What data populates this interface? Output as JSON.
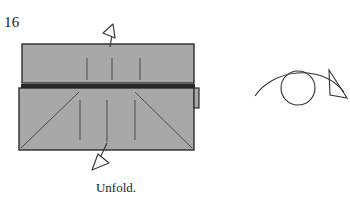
{
  "figure": {
    "step_number": "16",
    "caption": "Unfold."
  },
  "colors": {
    "background": "#ffffff",
    "paper_fill": "#a8a8a8",
    "paper_edge": "#2b2b2b",
    "crease_line": "#4a4a4a",
    "arrow_stroke": "#3a3a3a",
    "arrow_fill": "#ffffff",
    "turnover_stroke": "#333333",
    "shadow_band": "#262626"
  },
  "diagram": {
    "upper_panel": {
      "name": "upper-paper-panel",
      "x": 22,
      "y": 44,
      "width": 172,
      "height": 39,
      "creases": [
        {
          "x": 87,
          "y1": 58,
          "y2": 80
        },
        {
          "x": 112,
          "y1": 58,
          "y2": 80
        },
        {
          "x": 140,
          "y1": 58,
          "y2": 80
        }
      ]
    },
    "lower_panel": {
      "name": "lower-paper-panel",
      "x": 19,
      "y": 88,
      "width": 175,
      "height": 62,
      "creases": [
        {
          "x": 80,
          "y1": 100,
          "y2": 140
        },
        {
          "x": 107,
          "y1": 100,
          "y2": 142
        },
        {
          "x": 135,
          "y1": 100,
          "y2": 140
        }
      ],
      "diagonals": [
        {
          "x1": 21,
          "y1": 148,
          "x2": 79,
          "y2": 92
        },
        {
          "x1": 192,
          "y1": 148,
          "x2": 135,
          "y2": 92
        }
      ]
    },
    "shadow_band": {
      "name": "fold-shadow-band",
      "x": 21,
      "y": 84,
      "width": 174,
      "height": 4
    },
    "right_flap": {
      "name": "right-edge-flap",
      "x": 194,
      "y": 88,
      "width": 5,
      "height": 20
    }
  },
  "arrows": {
    "unfold_up": {
      "name": "unfold-arrow-up",
      "label": "unfold-arrow-up",
      "stem": "M 110 47 L 112 35",
      "head": [
        [
          113,
          24
        ],
        [
          103,
          33
        ],
        [
          115,
          38
        ]
      ]
    },
    "unfold_down": {
      "name": "unfold-arrow-down",
      "label": "unfold-arrow-down",
      "stem": "M 107 143 L 100 158",
      "head": [
        [
          92,
          170
        ],
        [
          109,
          163
        ],
        [
          98,
          154
        ]
      ]
    },
    "turn_over": {
      "name": "turn-over-symbol",
      "label": "turn-over-symbol",
      "circle": {
        "cx": 298,
        "cy": 88,
        "r": 17
      },
      "arc": "M 255 96 C 272 70, 320 62, 344 92",
      "head": [
        [
          347,
          98
        ],
        [
          329,
          70
        ],
        [
          330,
          95
        ]
      ]
    }
  }
}
